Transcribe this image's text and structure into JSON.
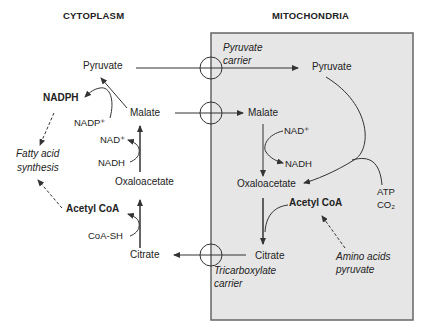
{
  "headers": {
    "left": "CYTOPLASM",
    "right": "MITOCHONDRIA"
  },
  "colors": {
    "mitochondria_fill": "#e6e6e6",
    "mitochondria_border": "#666666",
    "line": "#333333",
    "text": "#222222"
  },
  "cytoplasm": {
    "pyruvate": "Pyruvate",
    "nadph": "NADPH",
    "nadp_plus": "NADP⁺",
    "malate": "Malate",
    "nad_plus": "NAD⁺",
    "nadh": "NADH",
    "oxaloacetate": "Oxaloacetate",
    "acetyl_coa": "Acetyl CoA",
    "coa_sh": "CoA-SH",
    "citrate": "Citrate",
    "fatty_acid_line1": "Fatty acid",
    "fatty_acid_line2": "synthesis"
  },
  "mitochondria": {
    "pyruvate_carrier_line1": "Pyruvate",
    "pyruvate_carrier_line2": "carrier",
    "pyruvate": "Pyruvate",
    "malate": "Malate",
    "nad_plus": "NAD⁺",
    "nadh": "NADH",
    "oxaloacetate": "Oxaloacetate",
    "atp": "ATP",
    "co2": "CO₂",
    "acetyl_coa": "Acetyl CoA",
    "citrate": "Citrate",
    "tricarboxylate_line1": "Tricarboxylate",
    "tricarboxylate_line2": "carrier",
    "amino_line1": "Amino acids",
    "amino_line2": "pyruvate"
  }
}
